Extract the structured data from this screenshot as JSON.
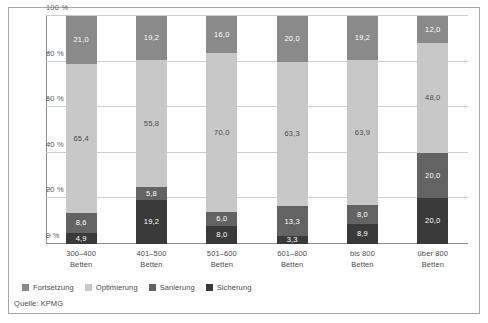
{
  "chart_data": {
    "type": "bar",
    "stacked": true,
    "stack_mode": "percent",
    "title": "",
    "subtitle": "",
    "xlabel": "",
    "ylabel": "",
    "ylim": [
      0,
      100
    ],
    "yticks": [
      "0 %",
      "20 %",
      "40 %",
      "60 %",
      "80 %",
      "100 %"
    ],
    "ytick_values": [
      0,
      20,
      40,
      60,
      80,
      100
    ],
    "grid": true,
    "legend_position": "bottom-left",
    "categories": [
      "300–400\nBetten",
      "401–500\nBetten",
      "501–600\nBetten",
      "601–800\nBetten",
      "bis 800\nBetten",
      "über 800\nBetten"
    ],
    "category_lines": [
      [
        "300–400",
        "Betten"
      ],
      [
        "401–500",
        "Betten"
      ],
      [
        "501–600",
        "Betten"
      ],
      [
        "601–800",
        "Betten"
      ],
      [
        "bis 800",
        "Betten"
      ],
      [
        "über 800",
        "Betten"
      ]
    ],
    "series": [
      {
        "name": "Sicherung",
        "color": "#3a3a3a",
        "order": 0,
        "values": [
          4.9,
          19.2,
          8.0,
          3.3,
          8.9,
          20.0
        ],
        "labels": [
          "4,9",
          "19,2",
          "8,0",
          "3,3",
          "8,9",
          "20,0"
        ]
      },
      {
        "name": "Sanierung",
        "color": "#636363",
        "order": 1,
        "values": [
          8.6,
          5.8,
          6.0,
          13.3,
          8.0,
          20.0
        ],
        "labels": [
          "8,6",
          "5,8",
          "6,0",
          "13,3",
          "8,0",
          "20,0"
        ]
      },
      {
        "name": "Optimierung",
        "color": "#c8c8c8",
        "order": 2,
        "values": [
          65.4,
          55.8,
          70.0,
          63.3,
          63.9,
          48.0
        ],
        "labels": [
          "65,4",
          "55,8",
          "70,0",
          "63,3",
          "63,9",
          "48,0"
        ]
      },
      {
        "name": "Fortsetzung",
        "color": "#8a8a8a",
        "order": 3,
        "values": [
          21.0,
          19.2,
          16.0,
          20.0,
          19.2,
          12.0
        ],
        "labels": [
          "21,0",
          "19,2",
          "16,0",
          "20,0",
          "19,2",
          "12,0"
        ]
      }
    ],
    "legend": [
      {
        "label": "Fortsetzung",
        "color": "#8a8a8a"
      },
      {
        "label": "Optimierung",
        "color": "#c8c8c8"
      },
      {
        "label": "Sanierung",
        "color": "#636363"
      },
      {
        "label": "Sicherung",
        "color": "#3a3a3a"
      }
    ],
    "source": "Quelle: KPMG",
    "colors": {
      "fortsetzung": "#8a8a8a",
      "optimierung": "#c8c8c8",
      "sanierung": "#636363",
      "sicherung": "#3a3a3a",
      "grid": "#c9cfd6",
      "axis": "#8c8c8c",
      "frame": "#a9a9a9",
      "text": "#4c4c4c"
    }
  }
}
